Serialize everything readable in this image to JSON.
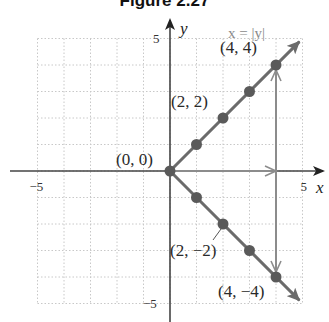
{
  "title": "Figure 2.27",
  "equation_label": "x = |y|",
  "axes": {
    "x_label": "x",
    "y_label": "y",
    "x_ticks": [
      {
        "value": -5,
        "label": "−5"
      },
      {
        "value": 5,
        "label": "5"
      }
    ],
    "y_ticks": [
      {
        "value": 5,
        "label": "5"
      },
      {
        "value": -5,
        "label": "−5"
      }
    ],
    "xlim": [
      -5,
      5
    ],
    "ylim": [
      -5,
      5
    ],
    "grid": true
  },
  "colors": {
    "graph": "#6b6b6b",
    "point": "#5a5a5a",
    "mapping_arrow": "#8c8c8c",
    "axis": "#444444",
    "grid": "#c8c8c8"
  },
  "chart_data": {
    "type": "line",
    "title": "Figure 2.27",
    "annotation": "x = |y|",
    "xlabel": "x",
    "ylabel": "y",
    "xlim": [
      -5,
      5
    ],
    "ylim": [
      -5,
      5
    ],
    "grid": true,
    "series": [
      {
        "name": "upper branch",
        "points": [
          [
            0,
            0
          ],
          [
            1,
            1
          ],
          [
            2,
            2
          ],
          [
            3,
            3
          ],
          [
            4,
            4
          ]
        ]
      },
      {
        "name": "lower branch",
        "points": [
          [
            0,
            0
          ],
          [
            1,
            -1
          ],
          [
            2,
            -2
          ],
          [
            3,
            -3
          ],
          [
            4,
            -4
          ]
        ]
      }
    ],
    "labeled_points": [
      {
        "x": 0,
        "y": 0,
        "label": "(0, 0)"
      },
      {
        "x": 2,
        "y": 2,
        "label": "(2, 2)"
      },
      {
        "x": 4,
        "y": 4,
        "label": "(4, 4)"
      },
      {
        "x": 2,
        "y": -2,
        "label": "(2, −2)"
      },
      {
        "x": 4,
        "y": -4,
        "label": "(4, −4)"
      }
    ],
    "mapping_arrows": [
      {
        "from": [
          0,
          0
        ],
        "to": [
          4,
          0
        ]
      },
      {
        "from": [
          4,
          0
        ],
        "to": [
          4,
          4
        ]
      },
      {
        "from": [
          4,
          0
        ],
        "to": [
          4,
          -4
        ]
      }
    ]
  }
}
